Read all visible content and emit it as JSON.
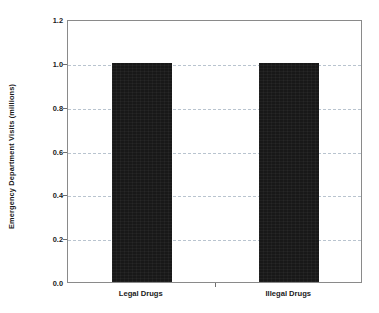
{
  "chart_data": {
    "type": "bar",
    "title": "",
    "xlabel": "",
    "ylabel": "Emergency Department Visits (millions)",
    "categories": [
      "Legal Drugs",
      "Illegal Drugs"
    ],
    "values": [
      1.0,
      1.0
    ],
    "ylim": [
      0.0,
      1.2
    ],
    "ytick_labels": [
      "0.0",
      "0.2",
      "0.4",
      "0.6",
      "0.8",
      "1.0",
      "1.2"
    ],
    "ytick_values": [
      0.0,
      0.2,
      0.4,
      0.6,
      0.8,
      1.0,
      1.2
    ],
    "grid": true,
    "grid_axis": "y",
    "grid_style": "dashed",
    "legend": false,
    "legend_position": "none",
    "series": [
      {
        "name": "Emergency Department Visits",
        "values": [
          1.0,
          1.0
        ]
      }
    ],
    "bar_color": "#181818",
    "grid_color": "#b9c4cf",
    "axis_color": "#8a8a8a",
    "background_color": "#ffffff"
  },
  "axes": {
    "y_title": "Emergency Department Visits (millions)",
    "y_ticks": [
      {
        "label": "1.2",
        "value": 1.2
      },
      {
        "label": "1.0",
        "value": 1.0
      },
      {
        "label": "0.8",
        "value": 0.8
      },
      {
        "label": "0.6",
        "value": 0.6
      },
      {
        "label": "0.4",
        "value": 0.4
      },
      {
        "label": "0.2",
        "value": 0.2
      },
      {
        "label": "0.0",
        "value": 0.0
      }
    ],
    "x_ticks": [
      {
        "label": "Legal Drugs"
      },
      {
        "label": "Illegal Drugs"
      }
    ]
  }
}
